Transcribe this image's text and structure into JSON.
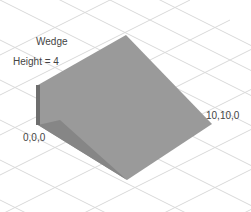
{
  "diagram": {
    "shape_name": "Wedge",
    "height_label": "Height = 4",
    "origin_label": "0,0,0",
    "corner_label": "10,10,0",
    "colors": {
      "top_face": "#9a9a9a",
      "side_face": "#7d7d7d",
      "front_shadow": "#888888",
      "grid": "#d8d8d8",
      "edge": "#555555"
    }
  }
}
